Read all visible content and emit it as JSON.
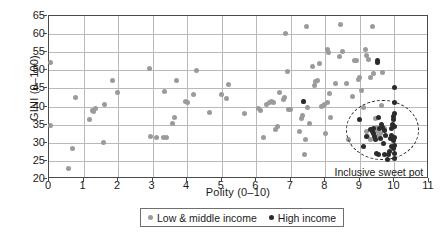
{
  "chart_data": {
    "type": "scatter",
    "title": "",
    "xlabel": "Polity (0–10)",
    "ylabel": "GINI (0–100)",
    "xlim": [
      0,
      11
    ],
    "ylim": [
      20,
      65
    ],
    "xticks": [
      0,
      1,
      2,
      3,
      4,
      5,
      6,
      7,
      8,
      9,
      10,
      11
    ],
    "yticks": [
      20,
      25,
      30,
      35,
      40,
      45,
      50,
      55,
      60,
      65
    ],
    "grid": true,
    "legend_position": "bottom",
    "annotations": [
      {
        "name": "inclusive-sweet-pot",
        "text": "Inclusive sweet pot",
        "shape": "dashed-ellipse",
        "cx": 9.65,
        "cy": 33.5,
        "rx": 1.05,
        "ry": 8.2,
        "label_x": 9.55,
        "label_y": 21.6
      }
    ],
    "colors": {
      "low_middle_income": "#9b9b9b",
      "high_income": "#2b2b2b",
      "grid": "#b9b9b9",
      "axis": "#4a4a4a"
    },
    "series": [
      {
        "name": "Low & middle income",
        "color": "#9b9b9b",
        "points": [
          [
            0.05,
            52.2
          ],
          [
            0.05,
            34.8
          ],
          [
            0.55,
            22.8
          ],
          [
            0.68,
            28.4
          ],
          [
            0.78,
            42.4
          ],
          [
            1.18,
            36.4
          ],
          [
            1.3,
            38.6
          ],
          [
            1.35,
            39.4
          ],
          [
            1.58,
            30.0
          ],
          [
            1.62,
            40.6
          ],
          [
            1.83,
            47.2
          ],
          [
            1.97,
            43.8
          ],
          [
            2.9,
            50.5
          ],
          [
            3.1,
            31.4
          ],
          [
            3.3,
            31.5
          ],
          [
            3.4,
            31.5
          ],
          [
            3.35,
            44.1
          ],
          [
            3.58,
            35.3
          ],
          [
            3.62,
            36.9
          ],
          [
            3.68,
            47.2
          ],
          [
            3.95,
            41.4
          ],
          [
            4.0,
            41.2
          ],
          [
            4.18,
            43.4
          ],
          [
            4.28,
            49.9
          ],
          [
            4.65,
            38.4
          ],
          [
            5.0,
            43.2
          ],
          [
            5.15,
            42.2
          ],
          [
            5.2,
            46.2
          ],
          [
            5.65,
            38.0
          ],
          [
            6.05,
            39.6
          ],
          [
            6.12,
            39.0
          ],
          [
            6.3,
            40.6
          ],
          [
            6.38,
            41.1
          ],
          [
            6.45,
            41.4
          ],
          [
            6.5,
            41.0
          ],
          [
            6.55,
            33.7
          ],
          [
            6.6,
            34.4
          ],
          [
            6.68,
            43.9
          ],
          [
            6.78,
            42.0
          ],
          [
            6.82,
            42.6
          ],
          [
            6.85,
            60.1
          ],
          [
            6.9,
            49.8
          ],
          [
            6.92,
            39.2
          ],
          [
            6.2,
            31.4
          ],
          [
            7.3,
            36.8
          ],
          [
            7.35,
            37.4
          ],
          [
            7.38,
            41.3
          ],
          [
            7.4,
            26.9
          ],
          [
            7.42,
            31.0
          ],
          [
            7.45,
            62.2
          ],
          [
            7.48,
            39.7
          ],
          [
            7.55,
            35.2
          ],
          [
            7.62,
            51.0
          ],
          [
            7.68,
            45.9
          ],
          [
            7.72,
            46.8
          ],
          [
            7.78,
            47.3
          ],
          [
            7.82,
            52.0
          ],
          [
            7.9,
            40.1
          ],
          [
            7.95,
            40.4
          ],
          [
            7.98,
            40.6
          ],
          [
            8.0,
            32.6
          ],
          [
            8.05,
            41.0
          ],
          [
            8.05,
            55.8
          ],
          [
            8.08,
            54.9
          ],
          [
            8.12,
            43.6
          ],
          [
            8.15,
            37.1
          ],
          [
            8.3,
            46.5
          ],
          [
            8.42,
            53.8
          ],
          [
            8.45,
            62.7
          ],
          [
            8.5,
            55.3
          ],
          [
            8.68,
            30.9
          ],
          [
            8.78,
            42.9
          ],
          [
            8.85,
            52.6
          ],
          [
            8.9,
            52.7
          ],
          [
            8.95,
            47.6
          ],
          [
            9.0,
            48.0
          ],
          [
            9.05,
            44.4
          ],
          [
            9.1,
            39.7
          ],
          [
            9.15,
            55.8
          ],
          [
            9.2,
            54.2
          ],
          [
            9.25,
            53.0
          ],
          [
            9.3,
            47.9
          ],
          [
            9.35,
            62.2
          ],
          [
            9.4,
            49.2
          ],
          [
            9.45,
            36.6
          ],
          [
            9.48,
            34.2
          ],
          [
            9.5,
            33.1
          ],
          [
            9.55,
            31.9
          ],
          [
            9.6,
            32.6
          ],
          [
            9.62,
            40.2
          ],
          [
            9.65,
            49.4
          ],
          [
            9.7,
            34.0
          ],
          [
            9.3,
            30.8
          ],
          [
            9.22,
            31.6
          ],
          [
            9.18,
            33.0
          ],
          [
            2.95,
            31.6
          ],
          [
            1.25,
            38.9
          ],
          [
            6.98,
            39.1
          ],
          [
            7.25,
            33.2
          ],
          [
            8.6,
            46.3
          ]
        ]
      },
      {
        "name": "High income",
        "color": "#2b2b2b",
        "points": [
          [
            7.38,
            41.3
          ],
          [
            9.0,
            36.4
          ],
          [
            9.1,
            29.1
          ],
          [
            9.2,
            31.6
          ],
          [
            9.3,
            33.6
          ],
          [
            9.35,
            33.2
          ],
          [
            9.38,
            32.6
          ],
          [
            9.4,
            34.0
          ],
          [
            9.42,
            31.8
          ],
          [
            9.45,
            30.9
          ],
          [
            9.48,
            27.0
          ],
          [
            9.5,
            52.7
          ],
          [
            9.52,
            52.3
          ],
          [
            9.55,
            26.9
          ],
          [
            9.58,
            33.9
          ],
          [
            9.6,
            31.1
          ],
          [
            9.62,
            35.1
          ],
          [
            9.65,
            34.3
          ],
          [
            9.68,
            29.8
          ],
          [
            9.7,
            33.4
          ],
          [
            9.72,
            26.8
          ],
          [
            9.75,
            32.1
          ],
          [
            9.8,
            25.4
          ],
          [
            9.82,
            26.9
          ],
          [
            9.85,
            27.6
          ],
          [
            9.88,
            31.3
          ],
          [
            9.9,
            32.0
          ],
          [
            9.92,
            33.9
          ],
          [
            9.94,
            35.0
          ],
          [
            9.96,
            36.5
          ],
          [
            9.97,
            37.2
          ],
          [
            9.98,
            30.6
          ],
          [
            9.98,
            28.4
          ],
          [
            9.99,
            25.6
          ],
          [
            10.0,
            45.2
          ],
          [
            10.0,
            41.0
          ],
          [
            10.0,
            38.0
          ],
          [
            10.0,
            34.5
          ],
          [
            10.0,
            31.5
          ],
          [
            10.0,
            29.2
          ],
          [
            10.0,
            27.0
          ],
          [
            9.55,
            37.1
          ],
          [
            9.9,
            29.0
          ]
        ]
      }
    ]
  },
  "legend": {
    "items": [
      {
        "label": "Low & middle income",
        "marker": "low-income-dot"
      },
      {
        "label": "High income",
        "marker": "high-income-dot"
      }
    ]
  }
}
